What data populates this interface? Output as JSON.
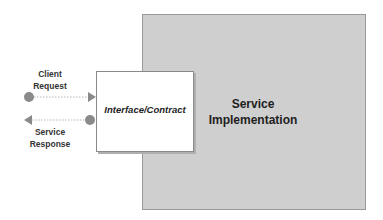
{
  "diagram": {
    "service_implementation": {
      "line1": "Service",
      "line2": "Implementation",
      "fill": "#cfcfcf"
    },
    "interface": {
      "label": "Interface/Contract",
      "fill": "#ffffff"
    },
    "client_request": {
      "line1": "Client",
      "line2": "Request",
      "direction": "right"
    },
    "service_response": {
      "line1": "Service",
      "line2": "Response",
      "direction": "left"
    },
    "connector_color": "#8a8a8a"
  }
}
